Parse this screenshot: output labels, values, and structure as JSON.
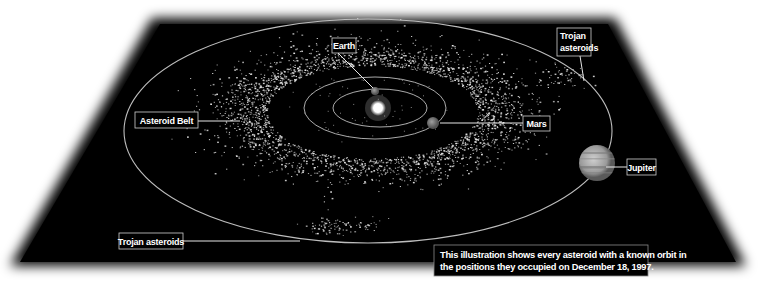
{
  "colors": {
    "background": "#ffffff",
    "panel": "#000000",
    "orbit": "#bdbdbd",
    "asteroid": "#e8e8e8",
    "label_border": "#cfcfcf",
    "label_text": "#ffffff",
    "sun": "#ffffff",
    "planet": "#8a8a8a",
    "jupiter": "#b5b5b5"
  },
  "labels": {
    "earth": "Earth",
    "trojan_top_line1": "Trojan",
    "trojan_top_line2": "asteroids",
    "asteroid_belt": "Asteroid Belt",
    "mars": "Mars",
    "jupiter": "Jupiter",
    "trojan_bottom": "Trojan asteroids"
  },
  "caption": {
    "line1": "This illustration shows every asteroid with a known orbit in",
    "line2": "the positions they occupied on December 18, 1997."
  },
  "bodies": {
    "sun": {
      "cx": 378,
      "cy": 108,
      "r": 8
    },
    "earth": {
      "cx": 375,
      "cy": 91,
      "r": 4
    },
    "mars": {
      "cx": 433,
      "cy": 123,
      "r": 6
    },
    "jupiter": {
      "cx": 597,
      "cy": 163,
      "r": 18
    }
  },
  "orbits": {
    "earth": {
      "cx": 380,
      "cy": 108,
      "rx": 47,
      "ry": 19
    },
    "mars": {
      "cx": 375,
      "cy": 108,
      "rx": 71,
      "ry": 31
    },
    "jupiter": {
      "cx": 368,
      "cy": 131,
      "rx": 244,
      "ry": 112
    }
  },
  "asteroid_field": {
    "belt_count": 2600,
    "trojan_count": 140,
    "seed": 1997
  }
}
